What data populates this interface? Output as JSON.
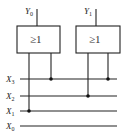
{
  "diagram": {
    "type": "logic-circuit",
    "gates": [
      {
        "id": "gate-0",
        "symbol": "≥1",
        "output_name": "Y",
        "output_sub": "0",
        "inputs": [
          "X1",
          "X3"
        ]
      },
      {
        "id": "gate-1",
        "symbol": "≥1",
        "output_name": "Y",
        "output_sub": "1",
        "inputs": [
          "X2",
          "X3"
        ]
      }
    ],
    "inputs": [
      {
        "name": "X",
        "sub": "3"
      },
      {
        "name": "X",
        "sub": "2"
      },
      {
        "name": "X",
        "sub": "1"
      },
      {
        "name": "X",
        "sub": "0"
      }
    ],
    "colors": {
      "line": "#222222",
      "background": "#ffffff"
    }
  }
}
